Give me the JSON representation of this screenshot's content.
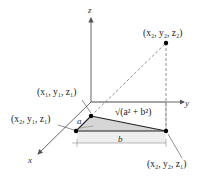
{
  "diagram": {
    "axes": {
      "x": "x",
      "y": "y",
      "z": "z"
    },
    "points": [
      {
        "id": "p_top",
        "label": "(x₂, y₂, z₂)"
      },
      {
        "id": "p1",
        "label": "(x₁, y₁, z₁)"
      },
      {
        "id": "p2",
        "label": "(x₂, y₁, z₁)"
      },
      {
        "id": "p3",
        "label": "(x₂, y₂, z₁)"
      }
    ],
    "segment_labels": {
      "a": "a",
      "b": "b",
      "hyp": "√(a² + b²)"
    },
    "colors": {
      "shade": "#d3d3d3",
      "line": "#333333",
      "axis": "#555555"
    }
  }
}
